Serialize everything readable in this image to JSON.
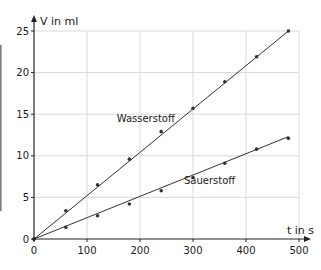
{
  "chart_data": {
    "type": "line",
    "title": "",
    "xlabel": "t in s",
    "ylabel": "V in ml",
    "xlim": [
      0,
      500
    ],
    "ylim": [
      0,
      25
    ],
    "x_ticks": [
      0,
      100,
      200,
      300,
      400,
      500
    ],
    "y_ticks": [
      0,
      5,
      10,
      15,
      20,
      25
    ],
    "grid": true,
    "legend": "inline labels",
    "x": [
      0,
      60,
      120,
      180,
      240,
      300,
      360,
      420,
      480
    ],
    "series": [
      {
        "name": "Wasserstoff",
        "values": [
          0,
          3.4,
          6.5,
          9.6,
          12.9,
          15.7,
          18.9,
          21.9,
          25.0
        ],
        "fit_line": {
          "from": [
            0,
            0
          ],
          "to": [
            480,
            25
          ]
        },
        "label_pos": [
          205,
          14.5
        ]
      },
      {
        "name": "Sauerstoff",
        "values": [
          0,
          1.4,
          2.8,
          4.2,
          5.8,
          7.4,
          9.1,
          10.8,
          12.1
        ],
        "fit_line": {
          "from": [
            0,
            0
          ],
          "to": [
            480,
            12.3
          ]
        },
        "label_pos": [
          315,
          7.1
        ]
      }
    ]
  },
  "colors": {
    "line": "#333333",
    "grid": "#d9d9d9",
    "axis": "#222222",
    "text": "#1a1a1a"
  }
}
